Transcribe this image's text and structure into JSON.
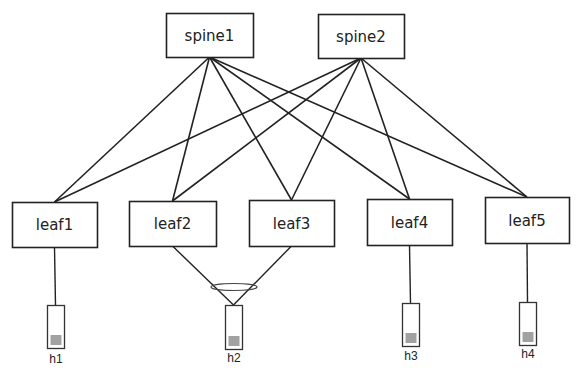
{
  "diagram": {
    "type": "leaf-spine network topology",
    "spines": [
      {
        "id": "spine1",
        "label": "spine1",
        "x": 166,
        "y": 13,
        "w": 87,
        "h": 44
      },
      {
        "id": "spine2",
        "label": "spine2",
        "x": 318,
        "y": 14,
        "w": 86,
        "h": 44
      }
    ],
    "leaves": [
      {
        "id": "leaf1",
        "label": "leaf1",
        "x": 12,
        "y": 202,
        "w": 85,
        "h": 45
      },
      {
        "id": "leaf2",
        "label": "leaf2",
        "x": 129,
        "y": 201,
        "w": 87,
        "h": 45
      },
      {
        "id": "leaf3",
        "label": "leaf3",
        "x": 249,
        "y": 200,
        "w": 85,
        "h": 46
      },
      {
        "id": "leaf4",
        "label": "leaf4",
        "x": 367,
        "y": 199,
        "w": 85,
        "h": 46
      },
      {
        "id": "leaf5",
        "label": "leaf5",
        "x": 485,
        "y": 197,
        "w": 84,
        "h": 46
      }
    ],
    "hosts": [
      {
        "id": "h1",
        "label": "h1",
        "x": 47,
        "y": 305,
        "w": 17,
        "h": 43,
        "label_y": 363
      },
      {
        "id": "h2",
        "label": "h2",
        "x": 225,
        "y": 305,
        "w": 17,
        "h": 44,
        "label_y": 362
      },
      {
        "id": "h3",
        "label": "h3",
        "x": 402,
        "y": 303,
        "w": 17,
        "h": 43,
        "label_y": 360
      },
      {
        "id": "h4",
        "label": "h4",
        "x": 519,
        "y": 302,
        "w": 17,
        "h": 43,
        "label_y": 358
      }
    ],
    "spine_leaf_links": [
      [
        "spine1",
        "leaf1"
      ],
      [
        "spine1",
        "leaf2"
      ],
      [
        "spine1",
        "leaf3"
      ],
      [
        "spine1",
        "leaf4"
      ],
      [
        "spine1",
        "leaf5"
      ],
      [
        "spine2",
        "leaf1"
      ],
      [
        "spine2",
        "leaf2"
      ],
      [
        "spine2",
        "leaf3"
      ],
      [
        "spine2",
        "leaf4"
      ],
      [
        "spine2",
        "leaf5"
      ]
    ],
    "host_links": [
      [
        "leaf1",
        "h1"
      ],
      [
        "leaf2",
        "h2"
      ],
      [
        "leaf3",
        "h2"
      ],
      [
        "leaf4",
        "h3"
      ],
      [
        "leaf5",
        "h4"
      ]
    ],
    "bond": {
      "label": "",
      "hosts": [
        "h2"
      ],
      "leaves": [
        "leaf2",
        "leaf3"
      ],
      "cx": 234,
      "cy": 287,
      "rx": 23,
      "ry": 3.5
    },
    "colors": {
      "stroke": "#222222",
      "host_stroke": "#333333",
      "background": "#ffffff"
    }
  }
}
